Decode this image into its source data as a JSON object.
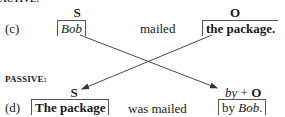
{
  "active": {
    "section_label": "ACTIVE:",
    "row_label": "(c)",
    "subject": {
      "tag": "S",
      "text": "Bob"
    },
    "verb": "mailed",
    "object": {
      "tag": "O",
      "text": "the package",
      "punct": "."
    }
  },
  "passive": {
    "section_label": "PASSIVE:",
    "row_label": "(d)",
    "subject": {
      "tag": "S",
      "text": "The package"
    },
    "verb": "was mailed",
    "agent": {
      "tag_prefix": "by",
      "tag_plus": " + ",
      "tag_o": "O",
      "by": "by ",
      "text": "Bob",
      "punct": "."
    }
  },
  "colors": {
    "text": "#1a1a1a",
    "lines": "#333333"
  }
}
